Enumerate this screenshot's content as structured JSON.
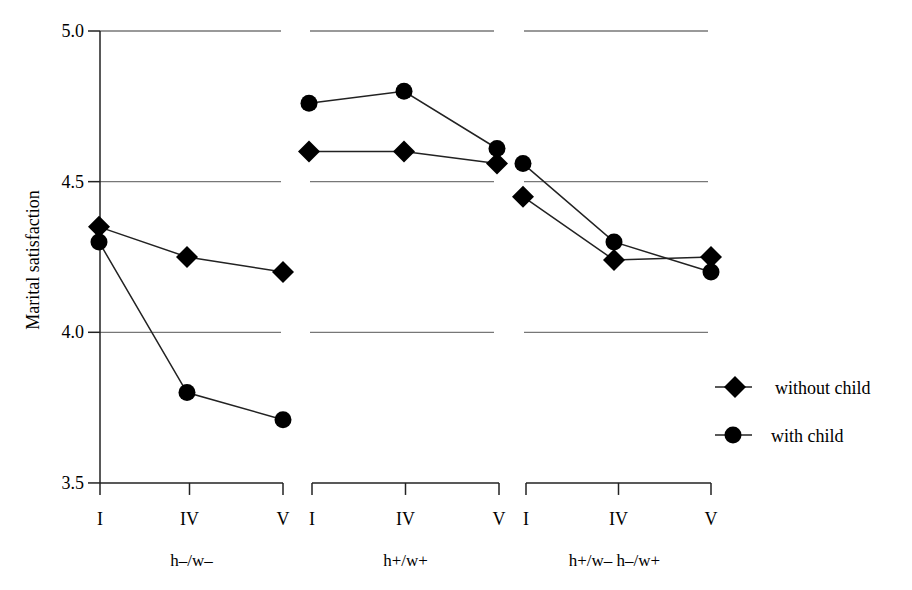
{
  "chart_data": {
    "type": "line",
    "title": "",
    "xlabel": "",
    "ylabel": "Marital satisfaction",
    "ylim": [
      3.5,
      5.0
    ],
    "yticks": [
      "3.5",
      "4.0",
      "4.5",
      "5.0"
    ],
    "grid": true,
    "legend_position": "right",
    "panels": [
      {
        "group": "h–/w–",
        "categories": [
          "I",
          "IV",
          "V"
        ],
        "series": [
          {
            "name": "without child",
            "marker": "diamond",
            "values": [
              4.35,
              4.25,
              4.2
            ]
          },
          {
            "name": "with child",
            "marker": "circle",
            "values": [
              4.3,
              3.8,
              3.71
            ]
          }
        ]
      },
      {
        "group": "h+/w+",
        "categories": [
          "I",
          "IV",
          "V"
        ],
        "series": [
          {
            "name": "without child",
            "marker": "diamond",
            "values": [
              4.6,
              4.6,
              4.56
            ]
          },
          {
            "name": "with child",
            "marker": "circle",
            "values": [
              4.76,
              4.8,
              4.61
            ]
          }
        ]
      },
      {
        "group": "h+/w– h–/w+",
        "categories": [
          "I",
          "IV",
          "V"
        ],
        "series": [
          {
            "name": "without child",
            "marker": "diamond",
            "values": [
              4.45,
              4.24,
              4.25
            ]
          },
          {
            "name": "with child",
            "marker": "circle",
            "values": [
              4.56,
              4.3,
              4.2
            ]
          }
        ]
      }
    ],
    "legend": [
      {
        "label": "without child",
        "marker": "diamond"
      },
      {
        "label": "with child",
        "marker": "circle"
      }
    ]
  },
  "colors": {
    "line": "#222222",
    "grid": "#777777",
    "marker": "#000000"
  }
}
